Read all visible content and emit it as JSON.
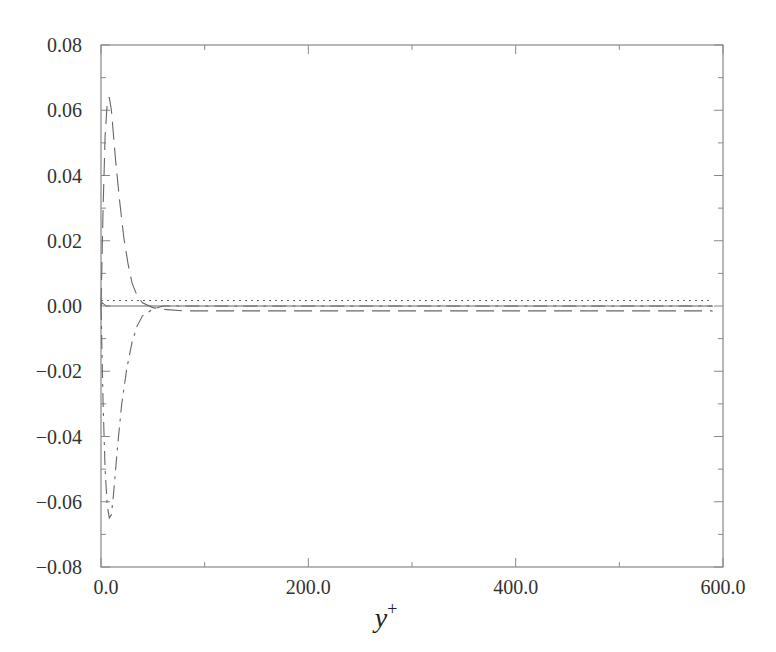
{
  "chart_data": {
    "type": "line",
    "title": "",
    "xlabel": "y",
    "xlabel_superscript": "+",
    "ylabel": "",
    "xlim": [
      0,
      600
    ],
    "ylim": [
      -0.08,
      0.08
    ],
    "grid": false,
    "legend": null,
    "x_ticks": [
      {
        "value": 0,
        "label": "0.0"
      },
      {
        "value": 200,
        "label": "200.0"
      },
      {
        "value": 400,
        "label": "400.0"
      },
      {
        "value": 600,
        "label": "600.0"
      }
    ],
    "x_minor_ticks": [
      100,
      300,
      500
    ],
    "y_ticks": [
      {
        "value": 0.08,
        "label": "0.08"
      },
      {
        "value": 0.06,
        "label": "0.06"
      },
      {
        "value": 0.04,
        "label": "0.04"
      },
      {
        "value": 0.02,
        "label": "0.02"
      },
      {
        "value": 0.0,
        "label": "0.00"
      },
      {
        "value": -0.02,
        "label": "−0.02"
      },
      {
        "value": -0.04,
        "label": "−0.04"
      },
      {
        "value": -0.06,
        "label": "−0.06"
      },
      {
        "value": -0.08,
        "label": "−0.08"
      }
    ],
    "y_minor_ticks": [
      0.07,
      0.05,
      0.03,
      0.01,
      -0.01,
      -0.03,
      -0.05,
      -0.07
    ],
    "series": [
      {
        "name": "solid",
        "style": "solid",
        "x": [
          0,
          1,
          3,
          5,
          10,
          20,
          40,
          60,
          100,
          200,
          400,
          590
        ],
        "values": [
          0.0,
          0.001,
          0.0005,
          0.0,
          0.0,
          0.0,
          0.0,
          0.0,
          0.0,
          0.0,
          0.0,
          0.0
        ]
      },
      {
        "name": "long-dash",
        "style": "dashed",
        "x": [
          0,
          2,
          4,
          6,
          8,
          10,
          14,
          18,
          22,
          26,
          30,
          35,
          40,
          50,
          60,
          80,
          100,
          200,
          400,
          590
        ],
        "values": [
          0.0,
          0.03,
          0.052,
          0.062,
          0.064,
          0.06,
          0.045,
          0.032,
          0.021,
          0.013,
          0.007,
          0.003,
          0.001,
          -0.0005,
          -0.001,
          -0.0015,
          -0.0015,
          -0.0015,
          -0.0015,
          -0.0015
        ]
      },
      {
        "name": "dash-dot",
        "style": "dashdot",
        "x": [
          0,
          2,
          4,
          6,
          8,
          10,
          12,
          16,
          20,
          25,
          30,
          35,
          40,
          50,
          60,
          80,
          100,
          200,
          400,
          590
        ],
        "values": [
          0.0,
          -0.03,
          -0.05,
          -0.061,
          -0.065,
          -0.064,
          -0.058,
          -0.043,
          -0.03,
          -0.019,
          -0.011,
          -0.006,
          -0.003,
          -0.001,
          0.0,
          0.0,
          0.0,
          0.0,
          0.0,
          0.0
        ]
      },
      {
        "name": "dotted",
        "style": "dotted",
        "x": [
          0,
          100,
          200,
          300,
          400,
          500,
          590
        ],
        "values": [
          0.0017,
          0.0017,
          0.0017,
          0.0017,
          0.0017,
          0.0017,
          0.0017
        ]
      }
    ]
  }
}
